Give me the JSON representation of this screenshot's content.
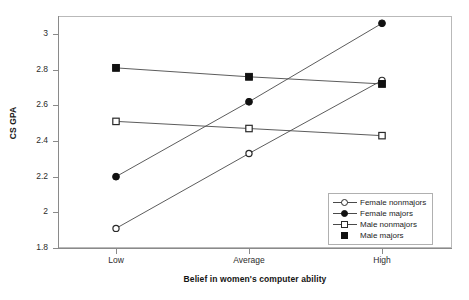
{
  "chart_data": {
    "type": "line",
    "title": "",
    "xlabel": "Belief in women's computer ability",
    "ylabel": "CS GPA",
    "categories": [
      "Low",
      "Average",
      "High"
    ],
    "ylim": [
      1.8,
      3.0
    ],
    "yticks": [
      "1.8",
      "2",
      "2.2",
      "2.4",
      "2.6",
      "2.8",
      "3"
    ],
    "ytick_values": [
      1.8,
      2.0,
      2.2,
      2.4,
      2.6,
      2.8,
      3.0
    ],
    "grid": false,
    "legend_position": "bottom-right",
    "series": [
      {
        "name": "Female nonmajors",
        "marker": "open-circle",
        "values": [
          1.91,
          2.33,
          2.74
        ]
      },
      {
        "name": "Female majors",
        "marker": "filled-circle",
        "values": [
          2.2,
          2.62,
          3.06
        ]
      },
      {
        "name": "Male nonmajors",
        "marker": "open-square",
        "values": [
          2.51,
          2.47,
          2.43
        ]
      },
      {
        "name": "Male majors",
        "marker": "filled-square",
        "values": [
          2.81,
          2.76,
          2.72
        ]
      }
    ],
    "colors": {
      "line": "#4a4a4a",
      "marker_fill": "#111111",
      "marker_stroke": "#2a2a2a",
      "axis": "#8a8a8a",
      "frame": "#b9b9b9",
      "background": "#ffffff"
    }
  },
  "legend": {
    "entries": [
      {
        "label": "Female nonmajors",
        "marker": "open-circle",
        "has_line": true
      },
      {
        "label": "Female majors",
        "marker": "filled-circle",
        "has_line": true
      },
      {
        "label": "Male nonmajors",
        "marker": "open-square",
        "has_line": true
      },
      {
        "label": "Male majors",
        "marker": "filled-square",
        "has_line": false
      }
    ]
  }
}
